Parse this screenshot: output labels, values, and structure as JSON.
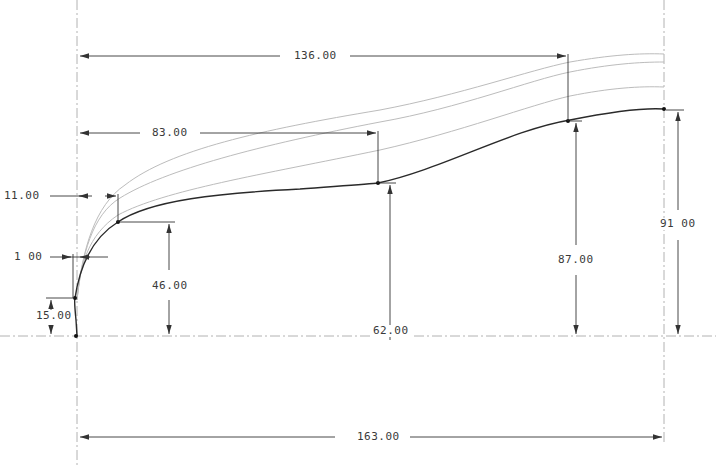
{
  "drawing": {
    "type": "CAD sketch with dimensions",
    "colors": {
      "background": "#ffffff",
      "main_curve": "#2a2a2a",
      "offset_curves": "#b8b8b8",
      "dimension_lines": "#333333",
      "centerlines": "#9a9a9a",
      "text": "#3a3a3a"
    },
    "dimensions": {
      "horizontal": [
        {
          "id": "dim-136",
          "label": "136.00"
        },
        {
          "id": "dim-83",
          "label": "83.00"
        },
        {
          "id": "dim-11",
          "label": "11.00"
        },
        {
          "id": "dim-1",
          "label": "1 00"
        },
        {
          "id": "dim-163",
          "label": "163.00"
        }
      ],
      "vertical": [
        {
          "id": "dim-15",
          "label": "15.00"
        },
        {
          "id": "dim-46",
          "label": "46.00"
        },
        {
          "id": "dim-62",
          "label": "62.00"
        },
        {
          "id": "dim-87",
          "label": "87.00"
        },
        {
          "id": "dim-91",
          "label": "91 00"
        }
      ]
    }
  }
}
